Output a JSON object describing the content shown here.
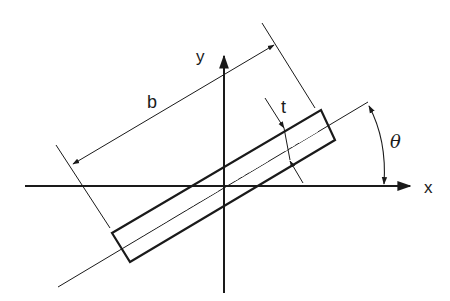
{
  "diagram": {
    "type": "rotated rectangular cross-section",
    "labels": {
      "x_axis": "x",
      "y_axis": "y",
      "width": "b",
      "thickness": "t",
      "angle": "θ"
    },
    "colors": {
      "stroke": "#1a1a1a",
      "background": "#ffffff"
    }
  }
}
